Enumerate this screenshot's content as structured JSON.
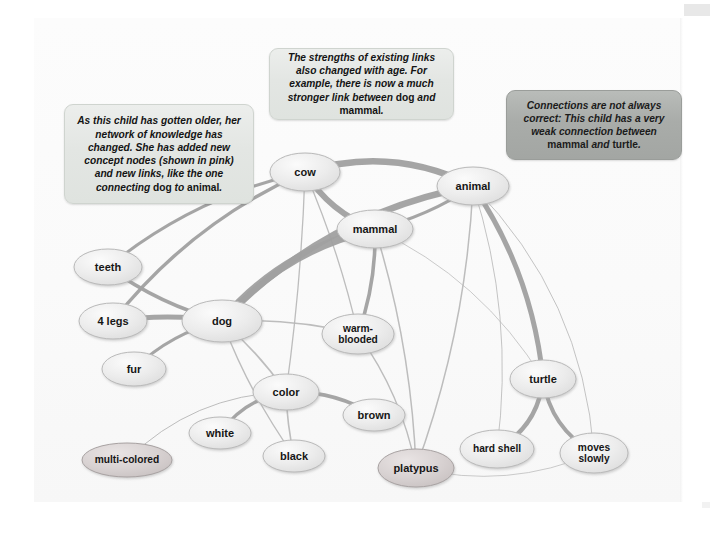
{
  "figure": {
    "type": "concept-map",
    "background": "#ffffff",
    "panel_color": "#fafafa"
  },
  "callouts": [
    {
      "id": "callout-left",
      "style": "light",
      "fill": "#e3e6e3",
      "text_parts": [
        {
          "t": "As this child has gotten older, her network of knowledge has changed. She has added new concept nodes (shown in pink) and new links, like the one connecting ",
          "style": "italic"
        },
        {
          "t": "dog",
          "style": "normal"
        },
        {
          "t": " to ",
          "style": "italic"
        },
        {
          "t": "animal",
          "style": "normal"
        },
        {
          "t": ".",
          "style": "italic"
        }
      ],
      "text": "As this child has gotten older, her network of knowledge has changed. She has added new concept nodes (shown in pink) and new links, like the one connecting dog to animal."
    },
    {
      "id": "callout-top",
      "style": "light",
      "fill": "#e3e6e3",
      "text_parts": [
        {
          "t": "The strengths of existing links also changed with age. For example, there is now a much stronger link between ",
          "style": "italic"
        },
        {
          "t": "dog",
          "style": "normal"
        },
        {
          "t": " and ",
          "style": "italic"
        },
        {
          "t": "mammal",
          "style": "normal"
        },
        {
          "t": ".",
          "style": "italic"
        }
      ],
      "text": "The strengths of existing links also changed with age. For example, there is now a much stronger link between dog and mammal."
    },
    {
      "id": "callout-right",
      "style": "dark",
      "fill": "#a9aca9",
      "text_parts": [
        {
          "t": "Connections are not always correct: This child has a very weak connection between ",
          "style": "italic"
        },
        {
          "t": "mammal",
          "style": "normal"
        },
        {
          "t": " and ",
          "style": "italic"
        },
        {
          "t": "turtle",
          "style": "normal"
        },
        {
          "t": ".",
          "style": "italic"
        }
      ],
      "text": "Connections are not always correct: This child has a very weak connection between mammal and turtle."
    }
  ],
  "chart_data": {
    "type": "diagram",
    "subtype": "semantic-network",
    "legend": {
      "pink_nodes": "new concept nodes added with age",
      "link_thickness": "strength of association between concepts"
    },
    "nodes": [
      {
        "id": "cow",
        "label": "cow",
        "x": 305,
        "y": 172,
        "rx": 35,
        "ry": 19,
        "color": "grey"
      },
      {
        "id": "animal",
        "label": "animal",
        "x": 473,
        "y": 186,
        "rx": 36,
        "ry": 19,
        "color": "grey"
      },
      {
        "id": "mammal",
        "label": "mammal",
        "x": 375,
        "y": 229,
        "rx": 38,
        "ry": 19,
        "color": "grey"
      },
      {
        "id": "teeth",
        "label": "teeth",
        "x": 108,
        "y": 267,
        "rx": 34,
        "ry": 18,
        "color": "grey"
      },
      {
        "id": "four_legs",
        "label": "4 legs",
        "x": 113,
        "y": 321,
        "rx": 34,
        "ry": 18,
        "color": "grey"
      },
      {
        "id": "dog",
        "label": "dog",
        "x": 222,
        "y": 321,
        "rx": 40,
        "ry": 21,
        "color": "grey"
      },
      {
        "id": "warm_blooded",
        "label": "warm-\nblooded",
        "x": 358,
        "y": 334,
        "rx": 36,
        "ry": 20,
        "color": "grey"
      },
      {
        "id": "fur",
        "label": "fur",
        "x": 134,
        "y": 369,
        "rx": 32,
        "ry": 17,
        "color": "grey"
      },
      {
        "id": "turtle",
        "label": "turtle",
        "x": 543,
        "y": 379,
        "rx": 33,
        "ry": 19,
        "color": "grey"
      },
      {
        "id": "color",
        "label": "color",
        "x": 286,
        "y": 392,
        "rx": 33,
        "ry": 18,
        "color": "grey"
      },
      {
        "id": "brown",
        "label": "brown",
        "x": 374,
        "y": 415,
        "rx": 31,
        "ry": 16,
        "color": "grey"
      },
      {
        "id": "white",
        "label": "white",
        "x": 220,
        "y": 433,
        "rx": 31,
        "ry": 16,
        "color": "grey"
      },
      {
        "id": "hard_shell",
        "label": "hard shell",
        "x": 497,
        "y": 449,
        "rx": 37,
        "ry": 19,
        "color": "grey"
      },
      {
        "id": "moves_slowly",
        "label": "moves\nslowly",
        "x": 594,
        "y": 453,
        "rx": 34,
        "ry": 20,
        "color": "grey"
      },
      {
        "id": "multi_colored",
        "label": "multi-colored",
        "x": 127,
        "y": 460,
        "rx": 45,
        "ry": 17,
        "color": "pink"
      },
      {
        "id": "black",
        "label": "black",
        "x": 294,
        "y": 456,
        "rx": 31,
        "ry": 16,
        "color": "grey"
      },
      {
        "id": "platypus",
        "label": "platypus",
        "x": 416,
        "y": 468,
        "rx": 38,
        "ry": 19,
        "color": "pink"
      }
    ],
    "edges": [
      {
        "from": "cow",
        "to": "animal",
        "strength": "strong",
        "width": 6.5
      },
      {
        "from": "cow",
        "to": "mammal",
        "strength": "strong",
        "width": 6.0
      },
      {
        "from": "cow",
        "to": "teeth",
        "strength": "medium",
        "width": 3.0
      },
      {
        "from": "cow",
        "to": "four_legs",
        "strength": "medium",
        "width": 3.4
      },
      {
        "from": "cow",
        "to": "warm_blooded",
        "strength": "weak",
        "width": 1.3
      },
      {
        "from": "cow",
        "to": "color",
        "strength": "weak",
        "width": 1.3
      },
      {
        "from": "dog",
        "to": "mammal",
        "strength": "very-strong",
        "width": 8.0
      },
      {
        "from": "dog",
        "to": "animal",
        "strength": "strong",
        "width": 6.5
      },
      {
        "from": "dog",
        "to": "teeth",
        "strength": "medium",
        "width": 3.6
      },
      {
        "from": "dog",
        "to": "four_legs",
        "strength": "strong",
        "width": 5.2
      },
      {
        "from": "dog",
        "to": "fur",
        "strength": "medium",
        "width": 3.0
      },
      {
        "from": "dog",
        "to": "warm_blooded",
        "strength": "weak",
        "width": 1.4
      },
      {
        "from": "dog",
        "to": "color",
        "strength": "weak",
        "width": 1.6
      },
      {
        "from": "dog",
        "to": "black",
        "strength": "weak",
        "width": 1.4
      },
      {
        "from": "mammal",
        "to": "animal",
        "strength": "medium",
        "width": 3.2
      },
      {
        "from": "mammal",
        "to": "warm_blooded",
        "strength": "medium",
        "width": 3.6
      },
      {
        "from": "mammal",
        "to": "platypus",
        "strength": "weak",
        "width": 1.5
      },
      {
        "from": "mammal",
        "to": "turtle",
        "strength": "very-weak",
        "width": 0.8
      },
      {
        "from": "animal",
        "to": "turtle",
        "strength": "strong",
        "width": 5.0
      },
      {
        "from": "animal",
        "to": "platypus",
        "strength": "weak",
        "width": 1.5
      },
      {
        "from": "animal",
        "to": "moves_slowly",
        "strength": "very-weak",
        "width": 0.9
      },
      {
        "from": "animal",
        "to": "hard_shell",
        "strength": "very-weak",
        "width": 0.9
      },
      {
        "from": "turtle",
        "to": "hard_shell",
        "strength": "medium",
        "width": 4.4
      },
      {
        "from": "turtle",
        "to": "moves_slowly",
        "strength": "medium",
        "width": 4.0
      },
      {
        "from": "color",
        "to": "white",
        "strength": "medium",
        "width": 3.4
      },
      {
        "from": "color",
        "to": "black",
        "strength": "weak",
        "width": 1.6
      },
      {
        "from": "color",
        "to": "brown",
        "strength": "medium",
        "width": 3.6
      },
      {
        "from": "color",
        "to": "multi_colored",
        "strength": "very-weak",
        "width": 1.0
      },
      {
        "from": "platypus",
        "to": "moves_slowly",
        "strength": "very-weak",
        "width": 0.8
      },
      {
        "from": "warm_blooded",
        "to": "platypus",
        "strength": "weak",
        "width": 1.3
      }
    ],
    "colors": {
      "node_grey_fill": "#e9e9e9",
      "node_grey_stroke": "#b9b9b9",
      "node_pink_fill": "#d9d4d4",
      "node_pink_stroke": "#a8a2a2",
      "edge_strong": "#a0a0a0",
      "edge_weak": "#b6b6b6",
      "text": "#161616"
    }
  }
}
